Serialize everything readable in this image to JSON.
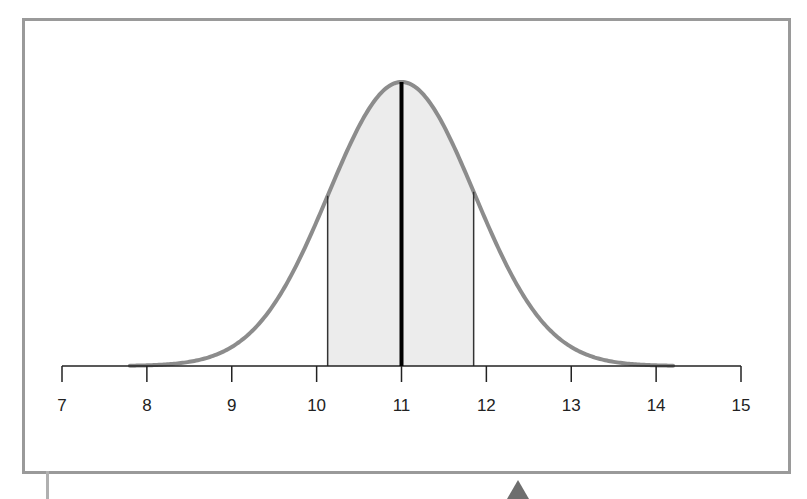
{
  "chart_data": {
    "type": "area",
    "title": "",
    "xlabel": "",
    "ylabel": "",
    "x_ticks": [
      "7",
      "8",
      "9",
      "10",
      "11",
      "12",
      "13",
      "14",
      "15"
    ],
    "xlim": [
      7,
      15
    ],
    "mean": 11,
    "std_dev_approx": 0.86,
    "shaded_region": {
      "from": 10.13,
      "to": 11.85
    },
    "mean_line": 11,
    "grid": false,
    "legend": null,
    "colors": {
      "curve": "#8c8c8c",
      "shade": "#ececec",
      "mean_line": "#000000",
      "axis": "#222222",
      "frame": "#9a9a9a",
      "arrow": "#6e6e6e"
    }
  }
}
